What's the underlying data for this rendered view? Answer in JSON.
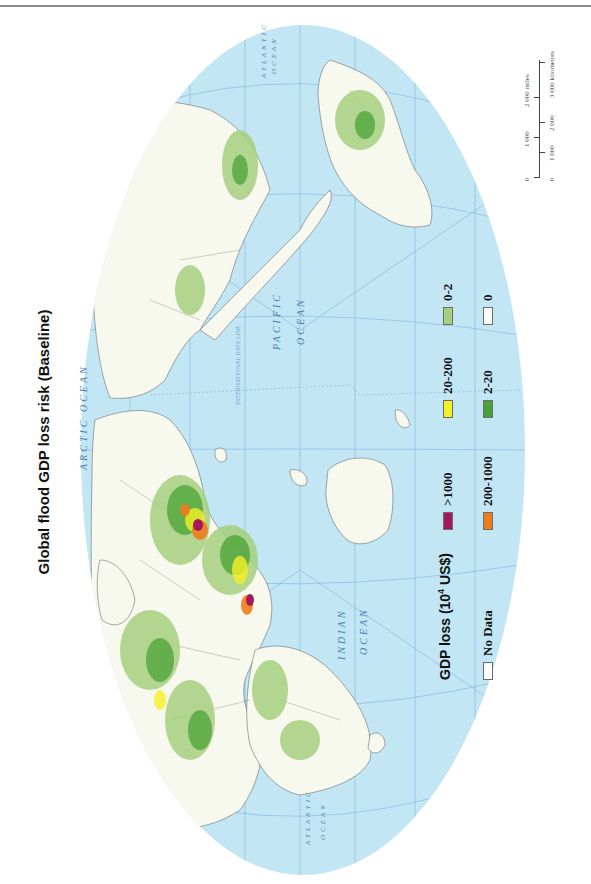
{
  "title": "Global flood GDP loss risk (Baseline)",
  "legend": {
    "title_prefix": "GDP loss (10",
    "title_exp": "4",
    "title_suffix": " US$)",
    "items": [
      {
        "label": "No Data",
        "color": "#ffffff"
      },
      {
        "label": ">1000",
        "color": "#a3195b"
      },
      {
        "label": "200-1000",
        "color": "#f07d1a"
      },
      {
        "label": "20-200",
        "color": "#f5f026"
      },
      {
        "label": "2-20",
        "color": "#4aa337"
      },
      {
        "label": "0-2",
        "color": "#a6cf7e"
      },
      {
        "label": "0",
        "color": "#fbfcf6"
      }
    ]
  },
  "scale_bar": {
    "miles_labels": [
      "0",
      "1 000",
      "2 000 miles"
    ],
    "km_labels": [
      "0",
      "1 000",
      "2 000",
      "3 000 kilometres"
    ]
  },
  "map": {
    "ocean_color": "#c4e6f5",
    "land_color": "#f8f9ee",
    "graticule_color": "#6fa6d6",
    "ocean_labels": [
      {
        "name": "ARCTIC OCEAN"
      },
      {
        "name": "PACIFIC",
        "line2": "OCEAN"
      },
      {
        "name": "INDIAN",
        "line2": "OCEAN"
      },
      {
        "name": "ATLANTIC",
        "line2": "OCEAN",
        "position": "top"
      },
      {
        "name": "ATLANTIC",
        "line2": "OCEAN",
        "position": "bottom"
      }
    ],
    "date_line_label": "INTERNATIONAL DATE LINE",
    "longitude_ticks": [
      "0°",
      "30°",
      "60°",
      "90°",
      "120°",
      "150°",
      "180°",
      "150°",
      "120°",
      "90°",
      "60°",
      "30°"
    ],
    "special_lines": [
      "Equator",
      "Tropic of Cancer",
      "Tropic of Capricorn",
      "Arctic Circle",
      "Antarctic Circle"
    ]
  }
}
